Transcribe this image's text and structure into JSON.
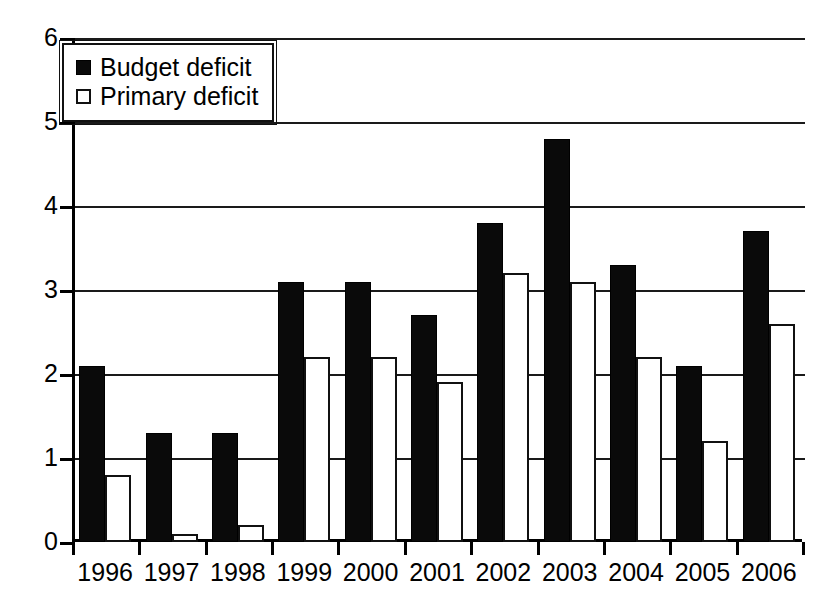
{
  "chart_data": {
    "type": "bar",
    "title": "",
    "subtitle": "",
    "xlabel": "",
    "ylabel": "",
    "categories": [
      "1996",
      "1997",
      "1998",
      "1999",
      "2000",
      "2001",
      "2002",
      "2003",
      "2004",
      "2005",
      "2006"
    ],
    "series": [
      {
        "name": "Budget deficit",
        "color": "#0a0a0a",
        "style": "filled-black",
        "values": [
          2.1,
          1.3,
          1.3,
          3.1,
          3.1,
          2.7,
          3.8,
          4.8,
          3.3,
          2.1,
          3.7
        ]
      },
      {
        "name": "Primary deficit",
        "color": "#ffffff",
        "style": "open-white",
        "values": [
          0.8,
          0.1,
          0.2,
          2.2,
          2.2,
          1.9,
          3.2,
          3.1,
          2.2,
          1.2,
          2.6
        ]
      }
    ],
    "ylim": [
      0,
      6
    ],
    "ytick_values": [
      0,
      1,
      2,
      3,
      4,
      5,
      6
    ],
    "ytick_labels": [
      "0",
      "1",
      "2",
      "3",
      "4",
      "5",
      "6"
    ],
    "grid": "horizontal",
    "legend_position": "top-left",
    "legend_entries": [
      "Budget deficit",
      "Primary deficit"
    ]
  },
  "legend": {
    "items": [
      {
        "label": "Budget deficit",
        "marker": "filled-square-icon"
      },
      {
        "label": "Primary deficit",
        "marker": "open-square-icon"
      }
    ]
  }
}
